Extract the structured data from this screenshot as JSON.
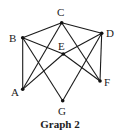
{
  "graph": {
    "caption": "Graph 2",
    "nodes": [
      {
        "id": "A",
        "label": "A",
        "x": 22.7,
        "y": 89.3,
        "lx": 11,
        "ly": 96
      },
      {
        "id": "B",
        "label": "B",
        "x": 22.7,
        "y": 37.7,
        "lx": 9,
        "ly": 42
      },
      {
        "id": "C",
        "label": "C",
        "x": 61.7,
        "y": 22.7,
        "lx": 57,
        "ly": 16
      },
      {
        "id": "D",
        "label": "D",
        "x": 101.7,
        "y": 33.3,
        "lx": 106,
        "ly": 37
      },
      {
        "id": "E",
        "label": "E",
        "x": 63.3,
        "y": 54.0,
        "lx": 58,
        "ly": 50
      },
      {
        "id": "F",
        "label": "F",
        "x": 100.0,
        "y": 81.0,
        "lx": 104,
        "ly": 86
      },
      {
        "id": "G",
        "label": "G",
        "x": 62.7,
        "y": 100.7,
        "lx": 58,
        "ly": 115
      }
    ],
    "edges": [
      [
        "A",
        "B"
      ],
      [
        "B",
        "C"
      ],
      [
        "C",
        "D"
      ],
      [
        "D",
        "F"
      ],
      [
        "A",
        "C"
      ],
      [
        "C",
        "F"
      ],
      [
        "B",
        "G"
      ],
      [
        "D",
        "G"
      ],
      [
        "A",
        "E"
      ],
      [
        "E",
        "D"
      ],
      [
        "B",
        "E"
      ],
      [
        "E",
        "F"
      ]
    ],
    "colors": {
      "edge": "#1a1a1a",
      "node": "#111111",
      "label": "#222222"
    }
  }
}
